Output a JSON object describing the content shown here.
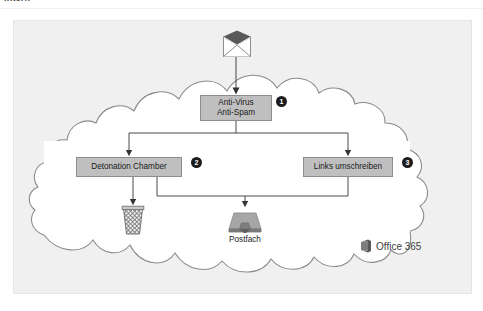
{
  "page": {
    "top_fragment": "Intern",
    "background_color": "#ffffff",
    "panel_color": "#f0f0f0"
  },
  "diagram": {
    "cloud_label": "Office 365 cloud",
    "nodes": [
      {
        "id": "anti-virus",
        "line1": "Anti-Virus",
        "line2": "Anti-Spam",
        "marker": "1",
        "fill": "#bfbfbf",
        "stroke": "#8e8e8e"
      },
      {
        "id": "detonation-chamber",
        "line1": "Detonation Chamber",
        "line2": "",
        "marker": "2",
        "fill": "#bfbfbf",
        "stroke": "#8e8e8e"
      },
      {
        "id": "links-umschreiben",
        "line1": "Links umschreiben",
        "line2": "",
        "marker": "3",
        "fill": "#bfbfbf",
        "stroke": "#8e8e8e"
      }
    ],
    "icons": [
      {
        "id": "incoming-mail",
        "name": "envelope-icon",
        "label": ""
      },
      {
        "id": "discard",
        "name": "trash-can-icon",
        "label": ""
      },
      {
        "id": "mailbox",
        "name": "inbox-tray-icon",
        "label": "Postfach"
      }
    ],
    "postfach_label": "Postfach",
    "brand": {
      "name": "Office 365",
      "icon": "office-logo-icon",
      "color": "#3f3f3f"
    },
    "colors": {
      "node_fill": "#bfbfbf",
      "node_stroke": "#8e8e8e",
      "cloud_fill": "#ffffff",
      "cloud_stroke": "#8a8a8a",
      "connector": "#4a4a4a",
      "marker_fill": "#1c1c1c",
      "marker_text": "#ffffff"
    }
  }
}
